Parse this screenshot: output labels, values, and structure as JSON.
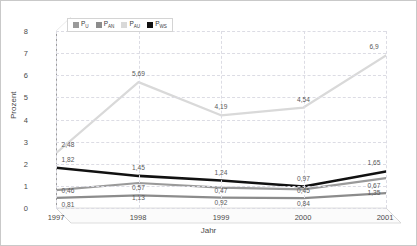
{
  "chart_data": {
    "type": "line",
    "title": "",
    "xlabel": "Jahr",
    "ylabel": "Prozent",
    "categories": [
      "1997",
      "1998",
      "1999",
      "2000",
      "2001"
    ],
    "ylim": [
      0,
      8
    ],
    "yticks": [
      "0",
      "1",
      "2",
      "3",
      "4",
      "5",
      "6",
      "7",
      "8"
    ],
    "grid": true,
    "legend_position": "top-left",
    "series": [
      {
        "name": "P_u",
        "label_html": "P<sub>U</sub>",
        "color": "#9a9a9a",
        "values": [
          0.81,
          1.13,
          0.92,
          0.84,
          1.35
        ],
        "point_labels": [
          "0,81",
          "1,13",
          "0,92",
          "0,84",
          "1,35"
        ]
      },
      {
        "name": "P_an",
        "label_html": "P<sub>AN</sub>",
        "color": "#8c8c8c",
        "values": [
          0.46,
          0.57,
          0.47,
          0.45,
          0.67
        ],
        "point_labels": [
          "0,46",
          "0,57",
          "0,47",
          "0,45",
          "0,67"
        ]
      },
      {
        "name": "P_au",
        "label_html": "P<sub>AU</sub>",
        "color": "#d9d9d9",
        "values": [
          2.48,
          5.69,
          4.19,
          4.54,
          6.9
        ],
        "point_labels": [
          "2,48",
          "5,69",
          "4,19",
          "4,54",
          "6,9"
        ]
      },
      {
        "name": "P_ws",
        "label_html": "P<sub>WS</sub>",
        "color": "#111111",
        "values": [
          1.82,
          1.45,
          1.24,
          0.97,
          1.65
        ],
        "point_labels": [
          "1,82",
          "1,45",
          "1,24",
          "0,97",
          "1,65"
        ]
      }
    ]
  },
  "colors": {
    "grid": "#dcdce4",
    "axis": "#9a9a9a",
    "text": "#4a4a4a",
    "frame": "#c9c9c9",
    "floor": "#f3f3f3"
  }
}
